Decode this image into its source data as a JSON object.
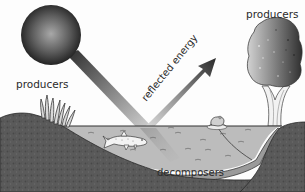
{
  "diagram": {
    "type": "pond-ecosystem",
    "labels": {
      "producers_left": "producers",
      "producers_right": "producers",
      "reflected_energy": "reflected energy",
      "decomposers": "decomposers"
    },
    "elements": [
      {
        "name": "sun",
        "icon": "sun-sphere"
      },
      {
        "name": "incoming-light-beam",
        "icon": "light-beam"
      },
      {
        "name": "reflected-energy-arrow",
        "icon": "arrow-up-right"
      },
      {
        "name": "reeds",
        "icon": "reed-plants"
      },
      {
        "name": "tree",
        "icon": "tree"
      },
      {
        "name": "pond-water",
        "icon": "water"
      },
      {
        "name": "fish",
        "icon": "fish"
      },
      {
        "name": "frog-on-lily-pad",
        "icon": "frog"
      },
      {
        "name": "sediment",
        "icon": "decomposer-layer"
      },
      {
        "name": "soil-left-bank",
        "icon": "soil"
      },
      {
        "name": "soil-right-bank",
        "icon": "soil"
      }
    ],
    "colors": {
      "background": "#fdfdfd",
      "sun_light": "#9a9a9a",
      "sun_dark": "#1e1e1e",
      "soil": "#5b5b5b",
      "soil_dark": "#474747",
      "water": "#bdbdbd",
      "water_surface": "#3a3a3a",
      "sediment": "#9e9e9e",
      "beam": "#8a8a8a",
      "tree_dark": "#3d3d3d",
      "tree_light": "#c9c9c9",
      "label": "#2a2a2a"
    }
  }
}
